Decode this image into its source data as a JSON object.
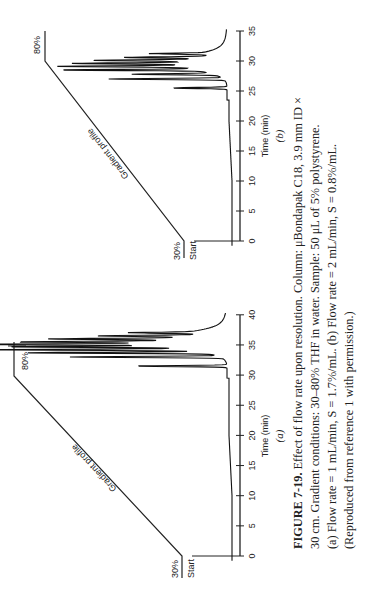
{
  "figure": {
    "number": "FIGURE 7-19.",
    "caption_lines": [
      "Effect of flow rate upon resolution. Column: μBondapak C18, 3.9 mm ID ×",
      "30 cm. Gradient conditions: 30–80% THF in water. Sample: 50 μL of 5% polystyrene.",
      "(a) Flow rate = 1 mL/min, S = 1.7%/mL. (b) Flow rate = 2 mL/min, S = 0.8%/mL.",
      "(Reproduced from reference 1 with permission.)"
    ]
  },
  "chart_data": [
    {
      "type": "line",
      "panel": "(a)",
      "title": "",
      "xlabel": "Time (min)",
      "ylabel": "",
      "xticks": [
        0,
        5,
        10,
        15,
        20,
        25,
        30,
        35,
        40
      ],
      "xlim": [
        0,
        40
      ],
      "annotations": [
        "Start",
        "30%",
        "80%",
        "Gradient profile"
      ],
      "gradient_profile": {
        "start_time": 0,
        "start_pct": 30,
        "end_time": 30,
        "end_pct": 80
      },
      "peaks_time_min": [
        31.5,
        33,
        33.7,
        34.2,
        34.7,
        35.1,
        35.5,
        36,
        36.5,
        37
      ],
      "peaks_rel_height": [
        0.45,
        0.75,
        0.9,
        1.0,
        0.8,
        0.95,
        0.7,
        0.6,
        0.45,
        0.3
      ]
    },
    {
      "type": "line",
      "panel": "(b)",
      "title": "",
      "xlabel": "Time (min)",
      "ylabel": "",
      "xticks": [
        0,
        5,
        10,
        15,
        20,
        25,
        30,
        35
      ],
      "xlim": [
        0,
        35
      ],
      "annotations": [
        "Start",
        "30%",
        "80%",
        "Gradient profile"
      ],
      "gradient_profile": {
        "start_time": 0,
        "start_pct": 30,
        "end_time": 30,
        "end_pct": 80
      },
      "peaks_time_min": [
        25.5,
        27,
        27.8,
        28.5,
        29.1,
        29.6,
        30.1,
        30.6,
        31.2
      ],
      "peaks_rel_height": [
        0.4,
        0.85,
        0.6,
        1.0,
        0.95,
        0.8,
        0.7,
        0.55,
        0.4
      ]
    }
  ],
  "panels": {
    "a": {
      "label": "(a)",
      "xlabel": "Time (min)",
      "start": "Start",
      "low_pct": "30%",
      "high_pct": "80%",
      "profile": "Gradient profile",
      "ticks": [
        "0",
        "5",
        "10",
        "15",
        "20",
        "25",
        "30",
        "35",
        "40"
      ]
    },
    "b": {
      "label": "(b)",
      "xlabel": "Time (min)",
      "start": "Start",
      "low_pct": "30%",
      "high_pct": "80%",
      "profile": "Gradient profile",
      "ticks": [
        "0",
        "5",
        "10",
        "15",
        "20",
        "25",
        "30",
        "35"
      ]
    }
  }
}
